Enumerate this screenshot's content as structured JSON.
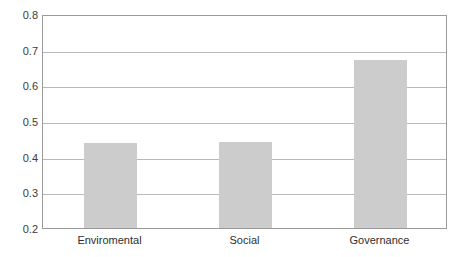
{
  "chart_data": {
    "type": "bar",
    "title": "",
    "subtitle": "",
    "xlabel": "",
    "ylabel": "",
    "categories": [
      "Enviromental",
      "Social",
      "Governance"
    ],
    "values": [
      0.439,
      0.441,
      0.672
    ],
    "series": [
      {
        "name": "",
        "values": [
          0.439,
          0.441,
          0.672
        ]
      }
    ],
    "ylim": [
      0.2,
      0.8
    ],
    "ytick_step": 0.1,
    "ytick_labels": [
      "0.8",
      "0.7",
      "0.6",
      "0.5",
      "0.4",
      "0.3",
      "0.2"
    ],
    "ytick_values": [
      0.8,
      0.7,
      0.6,
      0.5,
      0.4,
      0.3,
      0.2
    ],
    "grid": "horizontal",
    "legend": "none",
    "annotations": [],
    "colors": {
      "bar_fill": "#cccccc",
      "plot_border": "#9a9a9a",
      "gridline": "#b8b8b8",
      "axis_label_text": "#3b3b3b",
      "category_label_text": "#2e2e2e",
      "background": "#ffffff"
    }
  }
}
